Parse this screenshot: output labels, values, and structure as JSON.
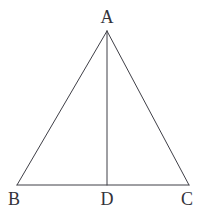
{
  "figure": {
    "kind": "geometry-diagram",
    "shape": "isosceles-triangle-with-altitude",
    "background_color": "#ffffff",
    "stroke_color": "#3f3f47",
    "stroke_width": 1,
    "label_color": "#33333a",
    "canvas": {
      "width": 205,
      "height": 215
    },
    "points": {
      "A": {
        "x": 107,
        "y": 31
      },
      "B": {
        "x": 17,
        "y": 185
      },
      "C": {
        "x": 189,
        "y": 185
      },
      "D": {
        "x": 107,
        "y": 185
      }
    },
    "segments": [
      {
        "name": "AB",
        "from": "A",
        "to": "B"
      },
      {
        "name": "AC",
        "from": "A",
        "to": "C"
      },
      {
        "name": "BC",
        "from": "B",
        "to": "C"
      },
      {
        "name": "AD",
        "from": "A",
        "to": "D"
      }
    ],
    "labels": {
      "A": "A",
      "B": "B",
      "C": "C",
      "D": "D"
    }
  }
}
